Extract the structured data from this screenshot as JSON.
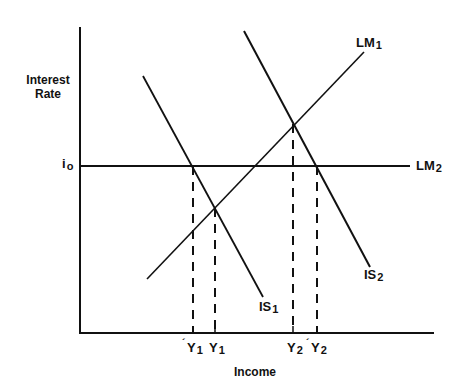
{
  "diagram": {
    "type": "IS-LM",
    "axes": {
      "y_label_line1": "Interest",
      "y_label_line2": "Rate",
      "x_label": "Income",
      "y_tick": {
        "main": "i",
        "sub": "o"
      }
    },
    "curves": {
      "IS1": {
        "main": "IS",
        "sub": "1"
      },
      "IS2": {
        "main": "IS",
        "sub": "2"
      },
      "LM1": {
        "main": "LM",
        "sub": "1"
      },
      "LM2": {
        "main": "LM",
        "sub": "2"
      }
    },
    "x_ticks": [
      {
        "main": "Y",
        "sub": "1",
        "accent": "´",
        "note": "Y1 with accent (tilde/prime)"
      },
      {
        "main": "Y",
        "sub": "1",
        "accent": ""
      },
      {
        "main": "Y",
        "sub": "2",
        "accent": ""
      },
      {
        "main": "Y",
        "sub": "2",
        "accent": "´",
        "note": "Y2 with accent (tilde/prime)"
      }
    ],
    "colors": {
      "line": "#111111",
      "background": "#ffffff"
    }
  }
}
